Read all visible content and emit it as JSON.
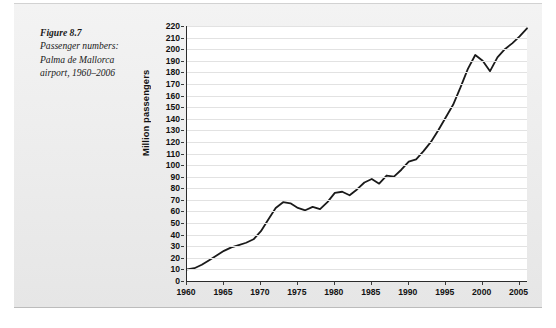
{
  "figure": {
    "label": "Figure 8.7",
    "caption": "Passenger numbers: Palma de Mallorca airport, 1960–2006"
  },
  "chart_data": {
    "type": "line",
    "title": "Passenger numbers: Palma de Mallorca airport, 1960–2006",
    "xlabel": "",
    "ylabel": "Million passengers",
    "xlim": [
      1960,
      2006
    ],
    "ylim": [
      0,
      220
    ],
    "ytick_step": 10,
    "yticks": [
      0,
      10,
      20,
      30,
      40,
      50,
      60,
      70,
      80,
      90,
      100,
      110,
      120,
      130,
      140,
      150,
      160,
      170,
      180,
      190,
      200,
      210,
      220
    ],
    "xticks": [
      1960,
      1965,
      1970,
      1975,
      1980,
      1985,
      1990,
      1995,
      2000,
      2005
    ],
    "grid": "horizontal",
    "legend": "none",
    "line_color": "#1a1a1a",
    "series": [
      {
        "name": "Million passengers",
        "x": [
          1960,
          1961,
          1962,
          1963,
          1964,
          1965,
          1966,
          1967,
          1968,
          1969,
          1970,
          1971,
          1972,
          1973,
          1974,
          1975,
          1976,
          1977,
          1978,
          1979,
          1980,
          1981,
          1982,
          1983,
          1984,
          1985,
          1986,
          1987,
          1988,
          1989,
          1990,
          1991,
          1992,
          1993,
          1994,
          1995,
          1996,
          1997,
          1998,
          1999,
          2000,
          2001,
          2002,
          2003,
          2004,
          2005,
          2006
        ],
        "values": [
          10,
          11,
          14,
          18,
          22,
          26,
          29,
          31,
          33,
          36,
          43,
          53,
          63,
          68,
          67,
          63,
          61,
          64,
          62,
          68,
          76,
          77,
          74,
          79,
          85,
          88,
          84,
          91,
          90,
          96,
          103,
          105,
          112,
          120,
          130,
          141,
          152,
          167,
          183,
          195,
          190,
          181,
          193,
          200,
          205,
          211,
          218
        ]
      }
    ]
  }
}
